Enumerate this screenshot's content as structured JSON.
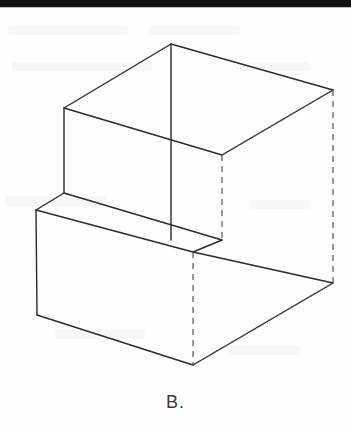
{
  "page": {
    "width": 351,
    "height": 432,
    "background_color": "#fefefe",
    "top_rule": {
      "name": "page-top-rule",
      "color": "#111111",
      "x": 0,
      "y": 0,
      "width": 351,
      "height": 7
    }
  },
  "caption": {
    "label": "B."
  },
  "figure": {
    "title": "B.",
    "type": "isometric-line-drawing",
    "stroke_color": "#2b2b2b",
    "stroke_width": 1.4,
    "hidden_stroke_color": "#555555",
    "hidden_dash_pattern": "6 5",
    "vertices": {
      "top_apex": [
        171,
        44
      ],
      "top_left": [
        64,
        108
      ],
      "top_right_rear": [
        333,
        90
      ],
      "top_front_right": [
        222,
        155
      ],
      "step_left_top": [
        64,
        193
      ],
      "step_left_front": [
        36,
        210
      ],
      "step_inner_right": [
        222,
        240
      ],
      "step_front_mid": [
        171,
        240
      ],
      "notch_shelf_right": [
        200,
        252
      ],
      "bottom_left": [
        37,
        315
      ],
      "bottom_mid": [
        193,
        365
      ],
      "bottom_right": [
        333,
        283
      ],
      "hidden_rear_right_top": [
        333,
        90
      ],
      "hidden_rear_right_bottom": [
        333,
        283
      ],
      "hidden_inner_vert_top": [
        222,
        155
      ],
      "hidden_inner_vert_bottom": [
        222,
        240
      ],
      "hidden_front_vert_top": [
        193,
        252
      ],
      "hidden_front_vert_bottom": [
        193,
        365
      ]
    },
    "visible_edges": [
      {
        "name": "top-face-left-ridge",
        "from": [
          171,
          44
        ],
        "to": [
          64,
          108
        ]
      },
      {
        "name": "top-face-right-ridge",
        "from": [
          171,
          44
        ],
        "to": [
          333,
          90
        ]
      },
      {
        "name": "top-face-center-vertical",
        "from": [
          171,
          44
        ],
        "to": [
          171,
          240
        ]
      },
      {
        "name": "top-face-front-left",
        "from": [
          64,
          108
        ],
        "to": [
          222,
          155
        ]
      },
      {
        "name": "top-face-front-right",
        "from": [
          222,
          155
        ],
        "to": [
          333,
          90
        ]
      },
      {
        "name": "upper-left-vertical",
        "from": [
          64,
          108
        ],
        "to": [
          64,
          193
        ]
      },
      {
        "name": "step-top-left-edge",
        "from": [
          64,
          193
        ],
        "to": [
          36,
          210
        ]
      },
      {
        "name": "step-top-front-edge",
        "from": [
          64,
          193
        ],
        "to": [
          222,
          240
        ]
      },
      {
        "name": "step-shelf-front-edge",
        "from": [
          36,
          210
        ],
        "to": [
          193,
          252
        ]
      },
      {
        "name": "step-shelf-right-edge",
        "from": [
          193,
          252
        ],
        "to": [
          222,
          240
        ]
      },
      {
        "name": "lower-left-vertical",
        "from": [
          36,
          210
        ],
        "to": [
          37,
          315
        ]
      },
      {
        "name": "bottom-front-left-edge",
        "from": [
          37,
          315
        ],
        "to": [
          193,
          365
        ]
      },
      {
        "name": "bottom-front-right-edge",
        "from": [
          193,
          365
        ],
        "to": [
          333,
          283
        ]
      },
      {
        "name": "lower-right-slant",
        "from": [
          193,
          252
        ],
        "to": [
          333,
          283
        ]
      },
      {
        "name": "lower-right-vertical-visible",
        "from": [
          333,
          283
        ],
        "to": [
          333,
          283
        ]
      }
    ],
    "hidden_edges": [
      {
        "name": "hidden-rear-right-vertical",
        "from": [
          333,
          90
        ],
        "to": [
          333,
          283
        ]
      },
      {
        "name": "hidden-inner-right-vertical",
        "from": [
          222,
          155
        ],
        "to": [
          222,
          240
        ]
      },
      {
        "name": "hidden-upper-rear-diagonal",
        "from": [
          222,
          155
        ],
        "to": [
          333,
          90
        ]
      },
      {
        "name": "hidden-front-vertical",
        "from": [
          193,
          252
        ],
        "to": [
          193,
          365
        ]
      },
      {
        "name": "hidden-bottom-rear-diagonal",
        "from": [
          193,
          365
        ],
        "to": [
          333,
          283
        ]
      }
    ]
  }
}
